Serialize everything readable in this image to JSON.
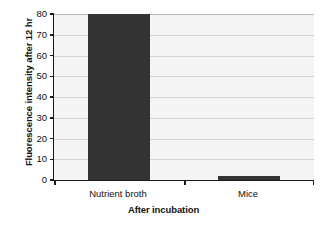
{
  "chart_data": {
    "type": "bar",
    "title": "",
    "categories": [
      "Nutrient broth",
      "Mice"
    ],
    "values": [
      80,
      2
    ],
    "series": [
      {
        "name": "Fluorescence intensity after 12 hr",
        "values": [
          80,
          2
        ]
      }
    ],
    "xlabel": "After incubation",
    "ylabel": "Fluorescence intensity after 12 hr",
    "ylim": [
      0,
      80
    ],
    "ytick_labels": [
      "0",
      "10",
      "20",
      "30",
      "40",
      "50",
      "60",
      "70",
      "80"
    ],
    "ytick_values": [
      0,
      10,
      20,
      30,
      40,
      50,
      60,
      70,
      80
    ],
    "grid": "horizontal",
    "legend": "none",
    "bar_color": "#333333",
    "plot_background": "#f4f4f4",
    "gridline_color": "#d2d2d2",
    "axis_color": "#1a1a1a"
  }
}
